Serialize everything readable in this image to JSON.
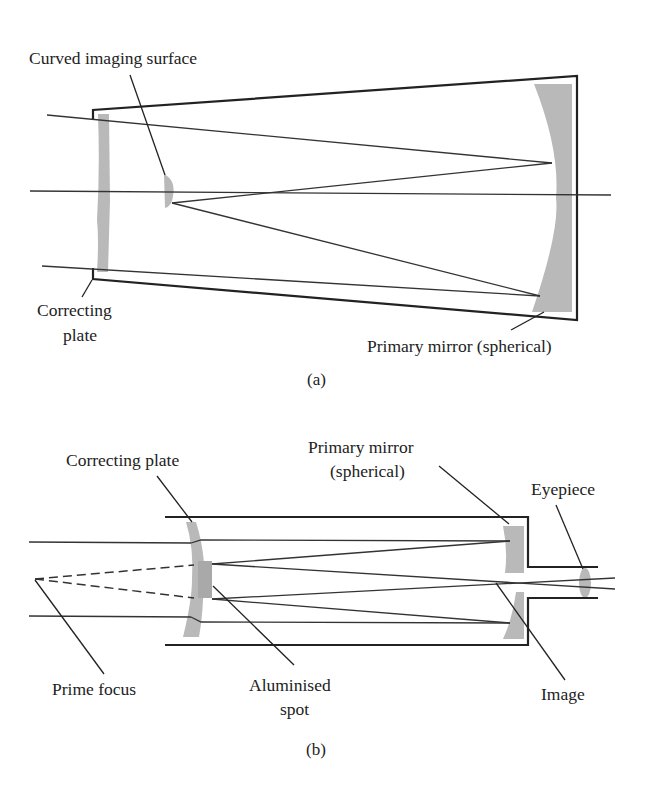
{
  "figure_a": {
    "caption": "(a)",
    "labels": {
      "curved_imaging_surface": "Curved imaging surface",
      "correcting_plate_line1": "Correcting",
      "correcting_plate_line2": "plate",
      "primary_mirror": "Primary mirror (spherical)"
    }
  },
  "figure_b": {
    "caption": "(b)",
    "labels": {
      "correcting_plate": "Correcting plate",
      "primary_mirror_line1": "Primary mirror",
      "primary_mirror_line2": "(spherical)",
      "eyepiece": "Eyepiece",
      "prime_focus": "Prime focus",
      "aluminised_spot_line1": "Aluminised",
      "aluminised_spot_line2": "spot",
      "image": "Image"
    }
  },
  "colors": {
    "line": "#222222",
    "glass": "#b9b9b9",
    "background": "#ffffff"
  }
}
